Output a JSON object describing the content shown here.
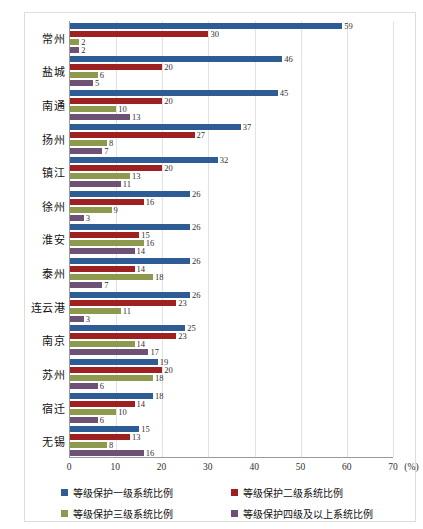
{
  "figure": {
    "top_caption_fragment": "",
    "x_unit_label": "(%)"
  },
  "legend": {
    "position": "bottom",
    "items": [
      {
        "label": "等级保护一级系统比例",
        "color": "#2e5c95"
      },
      {
        "label": "等级保护二级系统比例",
        "color": "#9e2020"
      },
      {
        "label": "等级保护三级系统比例",
        "color": "#8d9a4d"
      },
      {
        "label": "等级保护四级及以上系统比例",
        "color": "#6d5275"
      }
    ]
  },
  "chart_data": {
    "type": "bar",
    "orientation": "horizontal",
    "title": "",
    "xlabel": "(%)",
    "ylabel": "",
    "xlim": [
      0,
      70
    ],
    "xticks": [
      0,
      10,
      20,
      30,
      40,
      50,
      60,
      70
    ],
    "grid": true,
    "categories": [
      "常州",
      "盐城",
      "南通",
      "扬州",
      "镇江",
      "徐州",
      "淮安",
      "泰州",
      "连云港",
      "南京",
      "苏州",
      "宿迁",
      "无锡"
    ],
    "series": [
      {
        "name": "等级保护一级系统比例",
        "color": "#2e5c95",
        "values": [
          59,
          46,
          45,
          37,
          32,
          26,
          26,
          26,
          26,
          25,
          19,
          18,
          15
        ]
      },
      {
        "name": "等级保护二级系统比例",
        "color": "#9e2020",
        "values": [
          30,
          20,
          20,
          27,
          20,
          16,
          15,
          14,
          23,
          23,
          20,
          14,
          13
        ]
      },
      {
        "name": "等级保护三级系统比例",
        "color": "#8d9a4d",
        "values": [
          2,
          6,
          10,
          8,
          13,
          9,
          16,
          18,
          11,
          14,
          18,
          10,
          8
        ]
      },
      {
        "name": "等级保护四级及以上系统比例",
        "color": "#6d5275",
        "values": [
          2,
          5,
          13,
          7,
          11,
          3,
          14,
          7,
          3,
          17,
          6,
          6,
          16
        ]
      }
    ]
  }
}
